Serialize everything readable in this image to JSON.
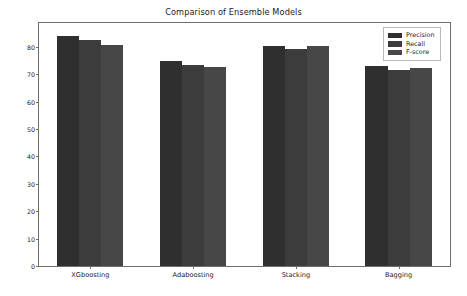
{
  "chart_data": {
    "type": "bar",
    "title": "Comparison of Ensemble Models",
    "xlabel": "",
    "ylabel": "Performance Metrics",
    "categories": [
      "XGboosting",
      "Adaboosting",
      "Stacking",
      "Bagging"
    ],
    "series": [
      {
        "name": "Precision",
        "values": [
          84.0,
          74.8,
          80.2,
          73.0
        ],
        "color": "#2f2f2f"
      },
      {
        "name": "Recall",
        "values": [
          82.5,
          73.3,
          79.2,
          71.5
        ],
        "color": "#3c3c3c"
      },
      {
        "name": "F-score",
        "values": [
          80.5,
          72.5,
          80.3,
          72.3
        ],
        "color": "#474747"
      }
    ],
    "ylim": [
      0,
      88.7
    ],
    "yticks": [
      0,
      10,
      20,
      30,
      40,
      50,
      60,
      70,
      80
    ],
    "ytick_labels": [
      "0",
      "10",
      "20",
      "30",
      "40",
      "50",
      "60",
      "70",
      "80"
    ],
    "grid": false,
    "legend_position": "upper right",
    "legend_entries": [
      "Precision",
      "Recall",
      "F-score"
    ]
  }
}
